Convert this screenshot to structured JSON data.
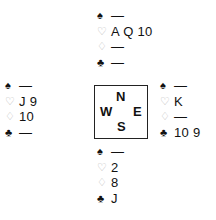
{
  "suit_symbols": {
    "spades": "♠",
    "hearts": "♡",
    "diamonds": "♢",
    "clubs": "♣"
  },
  "hands": {
    "north": {
      "spades": "—",
      "hearts": "A Q 10",
      "diamonds": "—",
      "clubs": "—"
    },
    "west": {
      "spades": "—",
      "hearts": "J 9",
      "diamonds": "10",
      "clubs": "—"
    },
    "east": {
      "spades": "—",
      "hearts": "K",
      "diamonds": "—",
      "clubs": "10 9"
    },
    "south": {
      "spades": "—",
      "hearts": "2",
      "diamonds": "8",
      "clubs": "J"
    }
  },
  "compass": {
    "north": "N",
    "west": "W",
    "east": "E",
    "south": "S"
  },
  "colors": {
    "black_suit": "#111111",
    "red_suit_outline": "#b8b8b8",
    "border": "#222222"
  }
}
